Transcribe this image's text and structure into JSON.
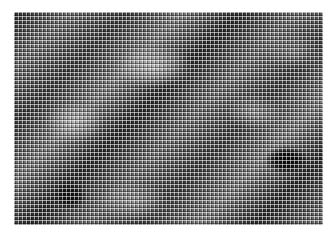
{
  "image": {
    "description": "Halftone dot-grid rendering of a blurred grayscale texture with diagonal light streaks and dark blobs",
    "background_color": "#ffffff",
    "texture_colors": [
      "#0a0a0a",
      "#444444",
      "#7a7a7a",
      "#c8c8c8"
    ]
  }
}
